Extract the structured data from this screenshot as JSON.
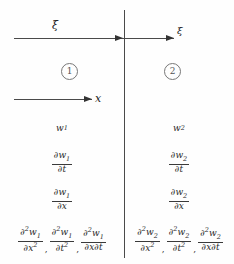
{
  "figure": {
    "background_color": "#fefefe",
    "line_color": "#4a4a4a"
  },
  "axes": {
    "xi_arrow_left": {
      "label": "ξ",
      "direction": "right"
    },
    "xi_arrow_right": {
      "label": "ξ",
      "direction": "right"
    },
    "x_arrow": {
      "label": "x",
      "direction": "right"
    },
    "interface_line": {
      "orientation": "vertical"
    }
  },
  "regions": [
    {
      "id": "region-1",
      "label": "1",
      "side": "left"
    },
    {
      "id": "region-2",
      "label": "2",
      "side": "right"
    }
  ],
  "quantities": {
    "left": {
      "w": {
        "base": "w",
        "sub": "1"
      },
      "dw_dt": {
        "num_op": "∂",
        "num_var": "w",
        "num_sub": "1",
        "den_op": "∂",
        "den_var": "t"
      },
      "dw_dx": {
        "num_op": "∂",
        "num_var": "w",
        "num_sub": "1",
        "den_op": "∂",
        "den_var": "x"
      },
      "second": [
        {
          "num_op": "∂",
          "num_sup": "2",
          "num_var": "w",
          "num_sub": "1",
          "den_op": "∂",
          "den_var": "x",
          "den_sup": "2"
        },
        {
          "num_op": "∂",
          "num_sup": "2",
          "num_var": "w",
          "num_sub": "1",
          "den_op": "∂",
          "den_var": "t",
          "den_sup": "2"
        },
        {
          "num_op": "∂",
          "num_sup": "2",
          "num_var": "w",
          "num_sub": "1",
          "den_op": "∂",
          "den_var": "x∂t",
          "den_sup": ""
        }
      ],
      "separator": ","
    },
    "right": {
      "w": {
        "base": "w",
        "sub": "2"
      },
      "dw_dt": {
        "num_op": "∂",
        "num_var": "w",
        "num_sub": "2",
        "den_op": "∂",
        "den_var": "t"
      },
      "dw_dx": {
        "num_op": "∂",
        "num_var": "w",
        "num_sub": "2",
        "den_op": "∂",
        "den_var": "x"
      },
      "second": [
        {
          "num_op": "∂",
          "num_sup": "2",
          "num_var": "w",
          "num_sub": "2",
          "den_op": "∂",
          "den_var": "x",
          "den_sup": "2"
        },
        {
          "num_op": "∂",
          "num_sup": "2",
          "num_var": "w",
          "num_sub": "2",
          "den_op": "∂",
          "den_var": "t",
          "den_sup": "2"
        },
        {
          "num_op": "∂",
          "num_sup": "2",
          "num_var": "w",
          "num_sub": "2",
          "den_op": "∂",
          "den_var": "x∂t",
          "den_sup": ""
        }
      ],
      "separator": ","
    }
  }
}
